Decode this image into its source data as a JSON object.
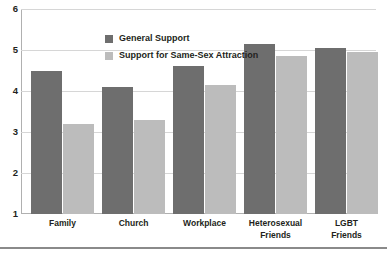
{
  "chart_data": {
    "type": "bar",
    "title": "",
    "subtitle": "",
    "xlabel": "",
    "ylabel": "",
    "ylim": [
      1,
      6
    ],
    "yticks": [
      6,
      5,
      4,
      3,
      2,
      1
    ],
    "grid": true,
    "legend_position": "top-center",
    "categories": [
      "Family",
      "Church",
      "Workplace",
      "Heterosexual Friends",
      "LGBT Friends"
    ],
    "category_lines": [
      [
        "Family"
      ],
      [
        "Church"
      ],
      [
        "Workplace"
      ],
      [
        "Heterosexual",
        "Friends"
      ],
      [
        "LGBT",
        "Friends"
      ]
    ],
    "series": [
      {
        "name": "General Support",
        "color": "#6e6e6e",
        "values": [
          4.5,
          4.1,
          4.6,
          5.15,
          5.05
        ]
      },
      {
        "name": "Support for Same-Sex Attraction",
        "color": "#bcbcbc",
        "values": [
          3.2,
          3.3,
          4.15,
          4.85,
          4.95
        ]
      }
    ]
  },
  "colors": {
    "series_general_support": "#6e6e6e",
    "series_same_sex_attraction": "#bcbcbc",
    "gridline": "#d6d6d6",
    "axis": "#b0b0b0",
    "text": "#231f20",
    "background": "#ffffff",
    "bottom_rule": "#8a8a8a"
  }
}
